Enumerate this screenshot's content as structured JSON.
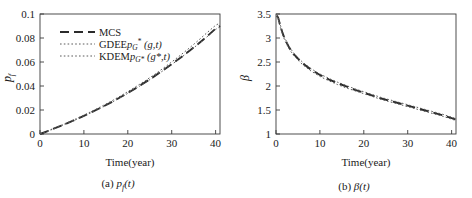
{
  "figure": {
    "panels": [
      {
        "id": "panel-a",
        "caption_prefix": "(a)",
        "caption_symbol": "p",
        "caption_sub": "f",
        "caption_suffix": "(t)",
        "xlabel": "Time(year)",
        "ylabel": "p",
        "ylabel_sub": "f"
      },
      {
        "id": "panel-b",
        "caption_prefix": "(b)",
        "caption_symbol": "β",
        "caption_sub": "",
        "caption_suffix": "(t)",
        "xlabel": "Time(year)",
        "ylabel": "β",
        "ylabel_sub": ""
      }
    ]
  },
  "legend": {
    "position": "upper-left",
    "entries": [
      {
        "label": "MCS",
        "style": "dashed",
        "color": "#2b2b2b",
        "width": 2.1
      },
      {
        "label": "GDEE",
        "math_base": "p",
        "math_sub": "G",
        "math_sup": "*",
        "math_args": "(g,t)",
        "style": "dotted",
        "color": "#555555",
        "width": 1.0
      },
      {
        "label": "KDEM",
        "math_base": "p",
        "math_sub": "G*",
        "math_sup": "",
        "math_args": "(g*,t)",
        "style": "dotted",
        "color": "#555555",
        "width": 1.0
      }
    ]
  },
  "chart_data": [
    {
      "type": "line",
      "title": "",
      "panel": "(a)",
      "xlabel": "Time(year)",
      "ylabel": "p_f",
      "xlim": [
        0,
        41
      ],
      "ylim": [
        0,
        0.1
      ],
      "xticks": [
        0,
        10,
        20,
        30,
        40
      ],
      "yticks": [
        0,
        0.02,
        0.04,
        0.06,
        0.08,
        0.1
      ],
      "ytick_labels": [
        "0",
        "0.02",
        "0.04",
        "0.06",
        "0.08",
        "0.1"
      ],
      "xtick_labels": [
        "0",
        "10",
        "20",
        "30",
        "40"
      ],
      "grid": false,
      "legend_position": "upper left",
      "x": [
        0,
        2,
        4,
        6,
        8,
        10,
        12,
        14,
        16,
        18,
        20,
        22,
        24,
        26,
        28,
        30,
        32,
        34,
        36,
        38,
        40,
        41
      ],
      "series": [
        {
          "name": "MCS",
          "style": "dashed",
          "values": [
            0.0,
            0.0028,
            0.0057,
            0.0087,
            0.0118,
            0.0151,
            0.0186,
            0.0222,
            0.026,
            0.03,
            0.0342,
            0.0386,
            0.0432,
            0.048,
            0.053,
            0.0582,
            0.0636,
            0.0692,
            0.075,
            0.0812,
            0.0878,
            0.09
          ]
        },
        {
          "name": "GDEE",
          "style": "dotted",
          "values": [
            0.0,
            0.003,
            0.006,
            0.0091,
            0.0123,
            0.0157,
            0.0193,
            0.023,
            0.0269,
            0.031,
            0.0353,
            0.0398,
            0.0445,
            0.0494,
            0.0546,
            0.06,
            0.0657,
            0.0716,
            0.0778,
            0.0843,
            0.0906,
            0.0925
          ]
        },
        {
          "name": "KDEM",
          "style": "dotted",
          "values": [
            0.0,
            0.0027,
            0.0055,
            0.0085,
            0.0116,
            0.0149,
            0.0183,
            0.0219,
            0.0257,
            0.0297,
            0.0339,
            0.0383,
            0.0429,
            0.0477,
            0.0527,
            0.0579,
            0.0633,
            0.0689,
            0.0747,
            0.0808,
            0.0872,
            0.0893
          ]
        }
      ]
    },
    {
      "type": "line",
      "title": "",
      "panel": "(b)",
      "xlabel": "Time(year)",
      "ylabel": "β",
      "xlim": [
        0,
        41
      ],
      "ylim": [
        1,
        3.5
      ],
      "xticks": [
        0,
        10,
        20,
        30,
        40
      ],
      "yticks": [
        1,
        1.5,
        2,
        2.5,
        3,
        3.5
      ],
      "ytick_labels": [
        "1",
        "1.5",
        "2",
        "2.5",
        "3",
        "3.5"
      ],
      "xtick_labels": [
        "0",
        "10",
        "20",
        "30",
        "40"
      ],
      "grid": false,
      "legend_position": "none",
      "x": [
        0.2,
        0.5,
        1,
        1.5,
        2,
        3,
        4,
        5,
        6,
        8,
        10,
        12,
        14,
        16,
        18,
        20,
        22,
        24,
        26,
        28,
        30,
        32,
        34,
        36,
        38,
        40,
        41
      ],
      "series": [
        {
          "name": "MCS",
          "style": "dashed",
          "values": [
            3.47,
            3.42,
            3.25,
            3.1,
            2.98,
            2.8,
            2.67,
            2.57,
            2.48,
            2.34,
            2.23,
            2.14,
            2.06,
            1.99,
            1.92,
            1.86,
            1.8,
            1.74,
            1.69,
            1.64,
            1.59,
            1.54,
            1.49,
            1.44,
            1.39,
            1.33,
            1.3
          ]
        },
        {
          "name": "GDEE",
          "style": "dotted",
          "values": [
            3.45,
            3.39,
            3.22,
            3.07,
            2.95,
            2.77,
            2.64,
            2.54,
            2.45,
            2.31,
            2.2,
            2.11,
            2.03,
            1.96,
            1.9,
            1.84,
            1.78,
            1.72,
            1.67,
            1.62,
            1.57,
            1.52,
            1.47,
            1.42,
            1.37,
            1.31,
            1.28
          ]
        },
        {
          "name": "KDEM",
          "style": "dotted",
          "values": [
            3.49,
            3.44,
            3.27,
            3.12,
            3.0,
            2.82,
            2.69,
            2.59,
            2.5,
            2.36,
            2.25,
            2.16,
            2.08,
            2.01,
            1.94,
            1.88,
            1.82,
            1.76,
            1.71,
            1.66,
            1.61,
            1.56,
            1.51,
            1.46,
            1.41,
            1.35,
            1.32
          ]
        }
      ]
    }
  ]
}
